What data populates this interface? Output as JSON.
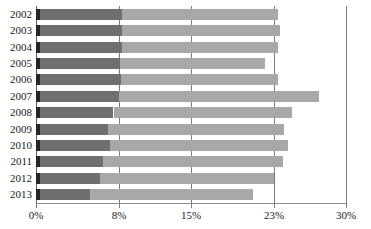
{
  "chart_data": {
    "type": "bar",
    "orientation": "horizontal",
    "stacked": true,
    "title": "",
    "xlabel": "",
    "ylabel": "",
    "categories": [
      "2002",
      "2003",
      "2004",
      "2005",
      "2006",
      "2007",
      "2008",
      "2009",
      "2010",
      "2011",
      "2012",
      "2013"
    ],
    "xtick_labels": [
      "0%",
      "8%",
      "15%",
      "23%",
      "30%"
    ],
    "xtick_values": [
      0,
      8,
      15,
      23,
      30
    ],
    "xlim": [
      0,
      30
    ],
    "grid": true,
    "legend": "none",
    "series": [
      {
        "name": "segment-1",
        "color": "#262626",
        "values": [
          0.4,
          0.4,
          0.4,
          0.4,
          0.4,
          0.4,
          0.4,
          0.4,
          0.4,
          0.4,
          0.4,
          0.4
        ]
      },
      {
        "name": "segment-2",
        "color": "#6f6f6f",
        "values": [
          7.9,
          7.9,
          7.9,
          7.7,
          7.8,
          7.6,
          7.1,
          6.6,
          6.8,
          6.1,
          5.8,
          4.8
        ]
      },
      {
        "name": "segment-3",
        "color": "#a8a8a8",
        "values": [
          15.1,
          15.3,
          15.1,
          14.1,
          15.2,
          19.4,
          17.3,
          17.0,
          17.2,
          17.4,
          16.8,
          15.8
        ]
      }
    ],
    "totals": [
      23.4,
      23.6,
      23.4,
      22.2,
      23.4,
      27.4,
      24.8,
      24.0,
      24.4,
      23.9,
      23.0,
      21.0
    ]
  },
  "colors": {
    "segment_1": "#262626",
    "segment_2": "#6f6f6f",
    "segment_3": "#a8a8a8",
    "gridline": "#7b7b7b",
    "axis": "#5d5d5d",
    "text": "#1a1a1a",
    "background": "#ffffff"
  }
}
